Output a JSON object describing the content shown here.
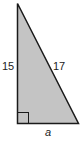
{
  "diagram": {
    "type": "right-triangle",
    "labels": {
      "left_leg": "15",
      "hypotenuse": "17",
      "base": "a"
    },
    "colors": {
      "fill": "#c4c4c4",
      "stroke": "#1a1a1a",
      "text": "#222222"
    },
    "right_angle_marker": true
  }
}
